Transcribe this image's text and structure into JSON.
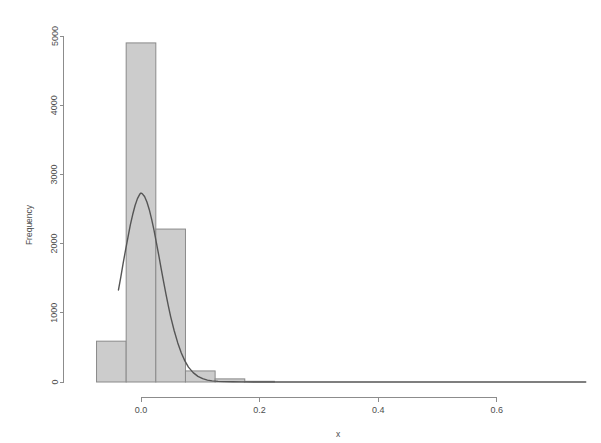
{
  "chart_data": {
    "type": "bar",
    "title": "",
    "subtitle": "",
    "xlabel": "x",
    "ylabel": "Frequency",
    "xlim": [
      -0.075,
      0.75
    ],
    "ylim": [
      0,
      5000
    ],
    "grid": false,
    "legend": "none",
    "bin_width": 0.05,
    "bin_edges": [
      -0.075,
      -0.025,
      0.025,
      0.075,
      0.125,
      0.175,
      0.225
    ],
    "categories": [
      "-0.075 to -0.025",
      "-0.025 to 0.025",
      "0.025 to 0.075",
      "0.075 to 0.125",
      "0.125 to 0.175",
      "0.175 to 0.225"
    ],
    "values": [
      590,
      4900,
      2210,
      160,
      45,
      10
    ],
    "bars": [
      {
        "x0": -0.075,
        "x1": -0.025,
        "height": 590
      },
      {
        "x0": -0.025,
        "x1": 0.025,
        "height": 4900
      },
      {
        "x0": 0.025,
        "x1": 0.075,
        "height": 2210
      },
      {
        "x0": 0.075,
        "x1": 0.125,
        "height": 160
      },
      {
        "x0": 0.125,
        "x1": 0.175,
        "height": 45
      },
      {
        "x0": 0.175,
        "x1": 0.225,
        "height": 10
      }
    ],
    "xticks": [
      0.0,
      0.2,
      0.4,
      0.6
    ],
    "xtick_labels": [
      "0.0",
      "0.2",
      "0.4",
      "0.6"
    ],
    "yticks": [
      0,
      1000,
      2000,
      3000,
      4000,
      5000
    ],
    "ytick_labels": [
      "0",
      "1000",
      "2000",
      "3000",
      "4000",
      "5000"
    ],
    "overlay": {
      "name": "density-curve",
      "type": "line",
      "peak_x": 0.0,
      "peak_y": 2730,
      "x_start": -0.038,
      "x_end": 0.75,
      "points": [
        [
          -0.038,
          1330
        ],
        [
          -0.034,
          1520
        ],
        [
          -0.03,
          1720
        ],
        [
          -0.026,
          1910
        ],
        [
          -0.022,
          2090
        ],
        [
          -0.018,
          2270
        ],
        [
          -0.014,
          2420
        ],
        [
          -0.01,
          2550
        ],
        [
          -0.006,
          2650
        ],
        [
          -0.002,
          2715
        ],
        [
          0.0,
          2730
        ],
        [
          0.002,
          2722
        ],
        [
          0.006,
          2680
        ],
        [
          0.01,
          2600
        ],
        [
          0.014,
          2490
        ],
        [
          0.018,
          2350
        ],
        [
          0.022,
          2190
        ],
        [
          0.026,
          2010
        ],
        [
          0.03,
          1830
        ],
        [
          0.034,
          1640
        ],
        [
          0.038,
          1455
        ],
        [
          0.042,
          1275
        ],
        [
          0.046,
          1105
        ],
        [
          0.05,
          945
        ],
        [
          0.056,
          740
        ],
        [
          0.062,
          565
        ],
        [
          0.068,
          420
        ],
        [
          0.074,
          305
        ],
        [
          0.08,
          215
        ],
        [
          0.088,
          135
        ],
        [
          0.096,
          82
        ],
        [
          0.104,
          48
        ],
        [
          0.112,
          27
        ],
        [
          0.12,
          16
        ],
        [
          0.13,
          9
        ],
        [
          0.14,
          5
        ],
        [
          0.155,
          3
        ],
        [
          0.17,
          2
        ],
        [
          0.19,
          1
        ],
        [
          0.22,
          1
        ],
        [
          0.3,
          0
        ],
        [
          0.45,
          0
        ],
        [
          0.6,
          0
        ],
        [
          0.75,
          0
        ]
      ]
    },
    "colors": {
      "bar_fill": "#cccccc",
      "bar_border": "#8a8a8a",
      "curve": "#555555",
      "axis": "#8c8c8c",
      "text": "#4d4d4d",
      "background": "#ffffff"
    }
  }
}
